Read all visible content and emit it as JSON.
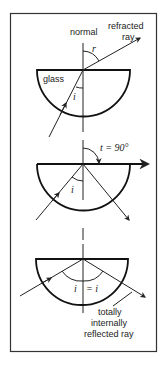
{
  "figure": {
    "type": "physics-optics-diagram",
    "colors": {
      "ink": "#222222",
      "background": "#ffffff",
      "frame": "#333333"
    }
  },
  "panels": [
    {
      "id": "refraction",
      "labels": {
        "normal": "normal",
        "refracted_line1": "refracted",
        "refracted_line2": "ray",
        "glass": "glass",
        "angle_r": "r",
        "angle_i": "i"
      }
    },
    {
      "id": "critical-angle",
      "labels": {
        "angle_t": "t = 90°",
        "angle_i": "i"
      }
    },
    {
      "id": "total-internal-reflection",
      "labels": {
        "angle_i_left": "i",
        "angle_equals": "= i",
        "tir_line1": "totally",
        "tir_line2": "internally",
        "tir_line3": "reflected ray"
      }
    }
  ]
}
